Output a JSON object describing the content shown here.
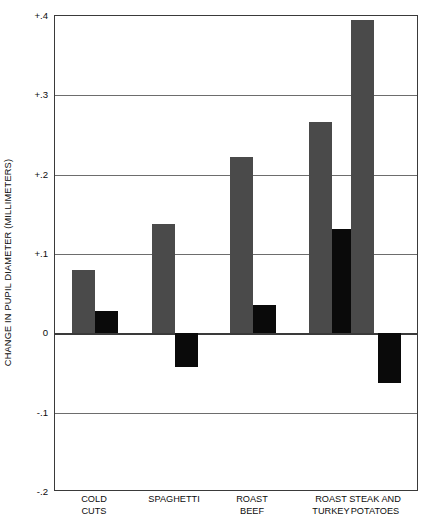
{
  "chart_data": {
    "type": "bar",
    "title": "",
    "xlabel": "",
    "ylabel": "CHANGE IN PUPIL DIAMETER (MILLIMETERS)",
    "categories": [
      "COLD CUTS",
      "SPAGHETTI",
      "ROAST BEEF",
      "ROAST TURKEY",
      "STEAK AND POTATOES"
    ],
    "category_lines": [
      [
        "COLD",
        "CUTS"
      ],
      [
        "SPAGHETTI"
      ],
      [
        "ROAST",
        "BEEF"
      ],
      [
        "ROAST",
        "TURKEY"
      ],
      [
        "STEAK AND",
        "POTATOES"
      ]
    ],
    "series": [
      {
        "name": "gray",
        "color": "#4a4a4a",
        "values": [
          0.08,
          0.138,
          0.222,
          0.266,
          0.395
        ]
      },
      {
        "name": "black",
        "color": "#0a0a0a",
        "values": [
          0.028,
          -0.043,
          0.036,
          0.131,
          -0.062
        ]
      }
    ],
    "ylim": [
      -0.2,
      0.4
    ],
    "yticks": [
      0.4,
      0.3,
      0.2,
      0.1,
      0,
      -0.1,
      -0.2
    ],
    "ytick_labels": [
      "+.4",
      "+.3",
      "+.2",
      "+.1",
      "0",
      "-.1",
      "-.2"
    ],
    "grid": true,
    "legend": "none",
    "zero_line": 0
  }
}
